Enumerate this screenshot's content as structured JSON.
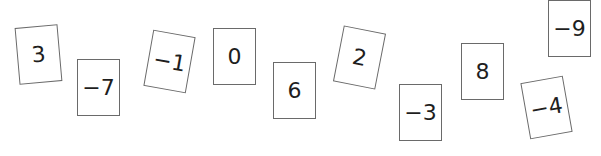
{
  "cards": [
    {
      "value": "3",
      "left": 17,
      "top": 26,
      "rotate": -5
    },
    {
      "value": "−7",
      "left": 77,
      "top": 59,
      "rotate": 0
    },
    {
      "value": "−1",
      "left": 148,
      "top": 33,
      "rotate": 10
    },
    {
      "value": "0",
      "left": 213,
      "top": 28,
      "rotate": 0
    },
    {
      "value": "6",
      "left": 273,
      "top": 62,
      "rotate": 0
    },
    {
      "value": "2",
      "left": 338,
      "top": 29,
      "rotate": 11
    },
    {
      "value": "−3",
      "left": 399,
      "top": 84,
      "rotate": 0
    },
    {
      "value": "8",
      "left": 461,
      "top": 43,
      "rotate": 0
    },
    {
      "value": "−4",
      "left": 525,
      "top": 79,
      "rotate": -10
    },
    {
      "value": "−9",
      "left": 548,
      "top": 0,
      "rotate": 0
    }
  ]
}
